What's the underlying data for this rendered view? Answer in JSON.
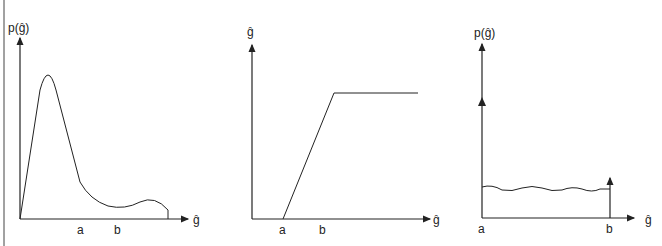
{
  "panels": [
    {
      "name": "histogram-input",
      "ylabel": "p(ĝ)",
      "xlabel": "ĝ",
      "ticks": [
        "a",
        "b"
      ]
    },
    {
      "name": "transfer-function",
      "ylabel": "ĝ",
      "xlabel": "ĝ",
      "ticks": [
        "a",
        "b"
      ]
    },
    {
      "name": "histogram-output",
      "ylabel": "p(ĝ)",
      "xlabel": "ĝ",
      "ticks": [
        "a",
        "b"
      ]
    }
  ],
  "colors": {
    "stroke": "#222222",
    "background": "#ffffff"
  }
}
